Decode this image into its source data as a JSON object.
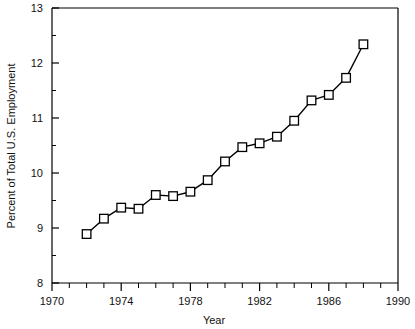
{
  "chart_data": {
    "type": "line",
    "title": "",
    "subtitle": "",
    "xlabel": "Year",
    "ylabel": "Percent of Total U.S. Employment",
    "xlim": [
      1970,
      1990
    ],
    "ylim": [
      8,
      13
    ],
    "xticks": [
      1970,
      1974,
      1978,
      1982,
      1986,
      1990
    ],
    "xtick_labels": [
      "1970",
      "1974",
      "1978",
      "1982",
      "1986",
      "1990"
    ],
    "xminor_tick_interval": 1,
    "yticks": [
      8,
      9,
      10,
      11,
      12,
      13
    ],
    "ytick_labels": [
      "8",
      "9",
      "10",
      "11",
      "12",
      "13"
    ],
    "yminor_tick_interval": 0.5,
    "grid": false,
    "legend": null,
    "marker": "square-open",
    "line_color": "#000000",
    "marker_face_color": "#ffffff",
    "marker_edge_color": "#000000",
    "x": [
      1972,
      1973,
      1974,
      1975,
      1976,
      1977,
      1978,
      1979,
      1980,
      1981,
      1982,
      1983,
      1984,
      1985,
      1986,
      1987,
      1988
    ],
    "values": [
      8.89,
      9.17,
      9.37,
      9.35,
      9.6,
      9.58,
      9.66,
      9.87,
      10.21,
      10.47,
      10.54,
      10.66,
      10.95,
      11.32,
      11.42,
      11.73,
      12.34
    ],
    "series": [
      {
        "name": "Percent of Total U.S. Employment",
        "x": [
          1972,
          1973,
          1974,
          1975,
          1976,
          1977,
          1978,
          1979,
          1980,
          1981,
          1982,
          1983,
          1984,
          1985,
          1986,
          1987,
          1988
        ],
        "values": [
          8.89,
          9.17,
          9.37,
          9.35,
          9.6,
          9.58,
          9.66,
          9.87,
          10.21,
          10.47,
          10.54,
          10.66,
          10.95,
          11.32,
          11.42,
          11.73,
          12.34
        ]
      }
    ]
  }
}
